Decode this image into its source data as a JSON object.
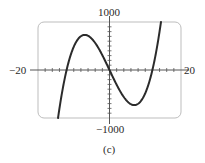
{
  "chart_data": {
    "type": "line",
    "title": "",
    "caption": "(c)",
    "xlabel": "",
    "ylabel": "",
    "xlim": [
      -20,
      20
    ],
    "ylim": [
      -1000,
      1000
    ],
    "x_tick_labels": [
      "-20",
      "20"
    ],
    "y_tick_labels": [
      "1000",
      "-1000"
    ],
    "x_tick_spacing": 2,
    "y_tick_spacing": 100,
    "grid": false,
    "legend": null,
    "function": "f(x) ≈ 1.1·x·(x² − 144)",
    "features": {
      "x_intercepts": [
        -12,
        0,
        12
      ],
      "local_max": {
        "x": -6.9,
        "y": 730
      },
      "local_min": {
        "x": 6.9,
        "y": -730
      }
    },
    "series": [
      {
        "name": "f(x)",
        "x": [
          -17,
          -16,
          -15,
          -14,
          -13,
          -12,
          -10,
          -8,
          -6.9,
          -6,
          -4,
          -2,
          0,
          2,
          4,
          6,
          6.9,
          8,
          10,
          12,
          13,
          14,
          15,
          16,
          17
        ],
        "y": [
          -2506,
          -1971,
          -1463,
          -1000,
          -580,
          0,
          484,
          704,
          730,
          713,
          563,
          308,
          0,
          -308,
          -563,
          -713,
          -730,
          -704,
          -484,
          0,
          580,
          1000,
          1463,
          1971,
          2506
        ]
      }
    ]
  },
  "labels": {
    "y_max": "1000",
    "y_min": "−1000",
    "x_min": "−20",
    "x_max": "20",
    "caption": "(c)"
  },
  "colors": {
    "curve": "#2b2b2b",
    "frame": "#bdbdbd",
    "axes": "#555555"
  }
}
